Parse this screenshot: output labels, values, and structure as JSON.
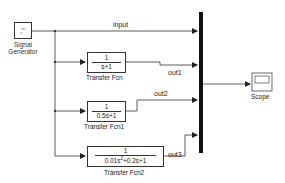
{
  "diagram": {
    "blocks": {
      "signal_generator": {
        "label_line1": "Signal",
        "label_line2": "Generator",
        "glyph_top": "▫▫▫▫",
        "glyph_bottom": "▫▫"
      },
      "transfer_fcn": {
        "label": "Transfer Fcn",
        "numerator": "1",
        "denominator": "s+1"
      },
      "transfer_fcn1": {
        "label": "Transfer Fcn1",
        "numerator": "1",
        "denominator": "0.5s+1"
      },
      "transfer_fcn2": {
        "label": "Transfer Fcn2",
        "numerator": "1",
        "denominator_a": "0.01s",
        "denominator_exp": "2",
        "denominator_b": "+0.2s+1"
      },
      "mux": {
        "label": ""
      },
      "scope": {
        "label": "Scope"
      }
    },
    "signals": {
      "input": "input",
      "out1": "out1",
      "out2": "out2",
      "out3": "out3"
    },
    "colors": {
      "line": "#333333",
      "mux": "#111111",
      "background": "#ffffff"
    }
  }
}
